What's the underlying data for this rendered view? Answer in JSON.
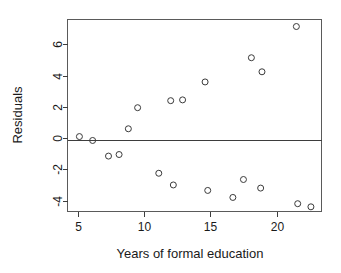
{
  "chart_data": {
    "type": "scatter",
    "title": "",
    "xlabel": "Years of formal education",
    "ylabel": "Residuals",
    "xlim": [
      4.2,
      23.4
    ],
    "ylim": [
      -4.7,
      7.6
    ],
    "xticks": [
      5,
      10,
      15,
      20
    ],
    "xticklabels": [
      "5",
      "10",
      "15",
      "20"
    ],
    "yticks": [
      6,
      4,
      2,
      0,
      -2,
      -4
    ],
    "yticklabels": [
      "6",
      "4",
      "2",
      "0",
      "-2",
      "-4"
    ],
    "grid": false,
    "legend": null,
    "reference_lines": [
      {
        "name": "zero-residual-line",
        "orientation": "horizontal",
        "y": -0.1
      }
    ],
    "marker": {
      "shape": "open-circle",
      "radius": 3,
      "color": "#3a3a3a"
    },
    "points": [
      {
        "x": 5.1,
        "y": 0.1
      },
      {
        "x": 6.1,
        "y": -0.15
      },
      {
        "x": 7.3,
        "y": -1.15
      },
      {
        "x": 8.1,
        "y": -1.05
      },
      {
        "x": 8.8,
        "y": 0.6
      },
      {
        "x": 9.5,
        "y": 1.95
      },
      {
        "x": 11.1,
        "y": -2.25
      },
      {
        "x": 12.0,
        "y": 2.4
      },
      {
        "x": 12.2,
        "y": -3.0
      },
      {
        "x": 12.9,
        "y": 2.45
      },
      {
        "x": 14.6,
        "y": 3.6
      },
      {
        "x": 14.8,
        "y": -3.35
      },
      {
        "x": 16.7,
        "y": -3.8
      },
      {
        "x": 17.5,
        "y": -2.65
      },
      {
        "x": 18.1,
        "y": 5.15
      },
      {
        "x": 18.8,
        "y": -3.2
      },
      {
        "x": 18.9,
        "y": 4.25
      },
      {
        "x": 21.5,
        "y": 7.15
      },
      {
        "x": 21.6,
        "y": -4.2
      },
      {
        "x": 22.6,
        "y": -4.4
      }
    ]
  },
  "axes": {
    "y_title": "Residuals",
    "x_title": "Years of formal education"
  },
  "colors": {
    "background": "#ffffff",
    "frame": "#5a5a5a",
    "marker": "#3a3a3a",
    "text": "#1a1a1a"
  }
}
